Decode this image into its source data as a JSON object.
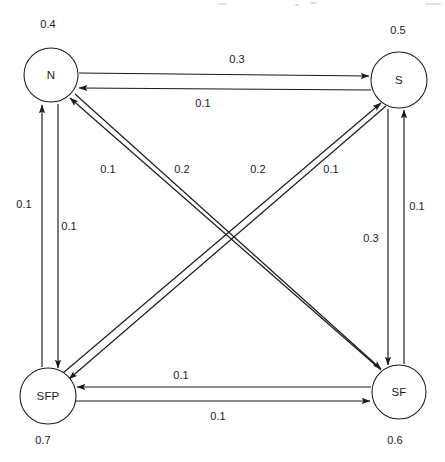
{
  "diagram": {
    "type": "state-transition-diagram",
    "nodes": [
      {
        "id": "N",
        "label": "N",
        "state_probability": "0.4",
        "cx": 51,
        "cy": 75,
        "r": 27,
        "prob_x": 48,
        "prob_y": 24
      },
      {
        "id": "S",
        "label": "S",
        "state_probability": "0.5",
        "cx": 399,
        "cy": 80,
        "r": 28,
        "prob_x": 398,
        "prob_y": 30
      },
      {
        "id": "SFP",
        "label": "SFP",
        "state_probability": "0.7",
        "cx": 48,
        "cy": 396,
        "r": 28,
        "prob_x": 43,
        "prob_y": 440
      },
      {
        "id": "SF",
        "label": "SF",
        "state_probability": "0.6",
        "cx": 399,
        "cy": 392,
        "r": 27,
        "prob_x": 395,
        "prob_y": 440
      }
    ],
    "edges": [
      {
        "from": "N",
        "to": "S",
        "weight": "0.3",
        "label_x": 237,
        "label_y": 59,
        "x1": 79,
        "y1": 73,
        "x2": 369,
        "y2": 76
      },
      {
        "from": "S",
        "to": "N",
        "weight": "0.1",
        "label_x": 203,
        "label_y": 103,
        "x1": 371,
        "y1": 90,
        "x2": 79,
        "y2": 88
      },
      {
        "from": "SFP",
        "to": "N",
        "weight": "0.1",
        "label_x": 24,
        "label_y": 204,
        "x1": 42,
        "y1": 367,
        "x2": 42,
        "y2": 105
      },
      {
        "from": "N",
        "to": "SFP",
        "weight": "0.1",
        "label_x": 69,
        "label_y": 226,
        "x1": 58,
        "y1": 104,
        "x2": 58,
        "y2": 368
      },
      {
        "from": "SF",
        "to": "S",
        "weight": "0.1",
        "label_x": 417,
        "label_y": 206,
        "x1": 404,
        "y1": 364,
        "x2": 404,
        "y2": 110
      },
      {
        "from": "S",
        "to": "SF",
        "weight": "0.3",
        "label_x": 371,
        "label_y": 238,
        "x1": 388,
        "y1": 109,
        "x2": 388,
        "y2": 365
      },
      {
        "from": "SFP",
        "to": "S",
        "weight": "0.1",
        "label_x": 108,
        "label_y": 169,
        "x1": 63,
        "y1": 373,
        "x2": 381,
        "y2": 103
      },
      {
        "from": "S",
        "to": "SFP",
        "weight": "0.2",
        "label_x": 182,
        "label_y": 169,
        "x1": 386,
        "y1": 106,
        "x2": 69,
        "y2": 379
      },
      {
        "from": "SF",
        "to": "N",
        "weight": "0.2",
        "label_x": 258,
        "label_y": 169,
        "x1": 381,
        "y1": 370,
        "x2": 70,
        "y2": 98
      },
      {
        "from": "N",
        "to": "SF",
        "weight": "0.1",
        "label_x": 331,
        "label_y": 169,
        "x1": 75,
        "y1": 94,
        "x2": 381,
        "y2": 369
      },
      {
        "from": "SF",
        "to": "SFP",
        "weight": "0.1",
        "label_x": 181,
        "label_y": 375,
        "x1": 371,
        "y1": 387,
        "x2": 77,
        "y2": 387
      },
      {
        "from": "SFP",
        "to": "SF",
        "weight": "0.1",
        "label_x": 218,
        "label_y": 416,
        "x1": 76,
        "y1": 401,
        "x2": 370,
        "y2": 401
      }
    ],
    "colors": {
      "stroke": "#1a1a1a",
      "node_fill": "#ffffff",
      "background": "#ffffff"
    }
  }
}
